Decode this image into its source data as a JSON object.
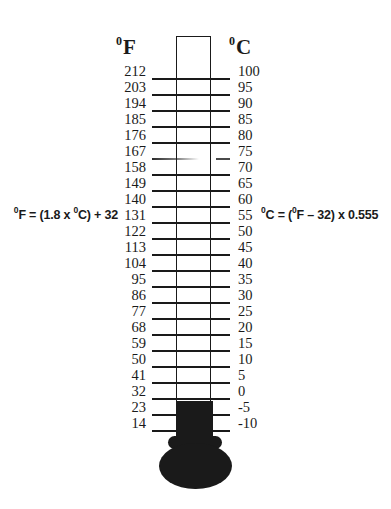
{
  "header": {
    "f_sup": "0",
    "f_letter": "F",
    "c_sup": "0",
    "c_letter": "C"
  },
  "formulas": {
    "fahrenheit": {
      "sup1": "0",
      "part1": "F = (1.8 x ",
      "sup2": "0",
      "part2": "C) + 32"
    },
    "celsius": {
      "sup1": "0",
      "part1": "C = (",
      "sup2": "0",
      "part2": "F – 32) x 0.555"
    }
  },
  "scale": {
    "fahrenheit_values": [
      "212",
      "203",
      "194",
      "185",
      "176",
      "167",
      "158",
      "149",
      "140",
      "131",
      "122",
      "113",
      "104",
      "95",
      "86",
      "77",
      "68",
      "59",
      "50",
      "41",
      "32",
      "23",
      "14"
    ],
    "celsius_values": [
      "100",
      "95",
      "90",
      "85",
      "80",
      "75",
      "70",
      "65",
      "60",
      "55",
      "50",
      "45",
      "40",
      "35",
      "30",
      "25",
      "20",
      "15",
      "10",
      "5",
      "0",
      "-5",
      "-10"
    ],
    "faded_row_index": 5
  },
  "colors": {
    "ink": "#1a1a1a",
    "background": "#ffffff",
    "mercury": "#1a1a1a"
  }
}
